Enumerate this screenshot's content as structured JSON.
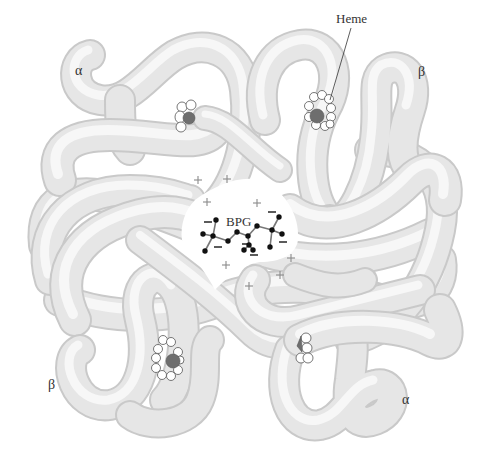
{
  "figure": {
    "labels": {
      "heme": "Heme",
      "bpg": "BPG",
      "subunit_top_left": "α",
      "subunit_top_right": "β",
      "subunit_bottom_left": "β",
      "subunit_bottom_right": "α"
    },
    "charges": {
      "positive_symbol": "+",
      "negative_symbol": "−",
      "positive_count": 8,
      "negative_count": 7
    },
    "colors": {
      "background": "#ffffff",
      "tube_fill": "#e6e6e6",
      "tube_shadow": "#c9c9c9",
      "heme_iron": "#6e6e6e",
      "bpg_atom": "#111111"
    }
  }
}
